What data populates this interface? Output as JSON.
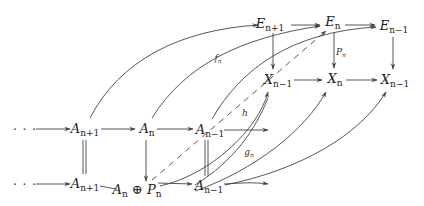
{
  "diagram": {
    "type": "commutative-diagram",
    "nodes": {
      "E_top_left": {
        "base": "E",
        "sub": "n+1",
        "x": 270,
        "y": 25
      },
      "E_top_mid": {
        "base": "E",
        "sub": "n",
        "x": 332,
        "y": 23
      },
      "E_top_right": {
        "base": "E",
        "sub": "n−1",
        "x": 392,
        "y": 27
      },
      "X_mid_left": {
        "base": "X",
        "sub": "n−1",
        "x": 278,
        "y": 81
      },
      "X_mid_mid": {
        "base": "X",
        "sub": "n",
        "x": 334,
        "y": 80
      },
      "X_mid_right": {
        "base": "X",
        "sub": "n−1",
        "x": 393,
        "y": 81
      },
      "A_row1_left": {
        "base": "A",
        "sub": "n+1",
        "x": 85,
        "y": 130
      },
      "A_row1_mid": {
        "base": "A",
        "sub": "n",
        "x": 147,
        "y": 130
      },
      "A_row1_right": {
        "base": "A",
        "sub": "n−1",
        "x": 209,
        "y": 131
      },
      "A_row2_left": {
        "base": "A",
        "sub": "n+1",
        "x": 85,
        "y": 185
      },
      "A_row2_sum": {
        "base": "A",
        "sub": "n",
        "op": "⊕",
        "base2": "P",
        "sub2": "n",
        "x": 135,
        "y": 191
      },
      "A_row2_right": {
        "base": "A",
        "sub": "n−1",
        "x": 207,
        "y": 187
      }
    },
    "ellipsis": {
      "text": "· · ·",
      "row1": {
        "x": 25,
        "y": 130
      },
      "row2": {
        "x": 25,
        "y": 185
      }
    },
    "arrow_labels": {
      "f_n": {
        "base": "f",
        "sub": "n",
        "x": 218,
        "y": 58
      },
      "P_n": {
        "base": "P",
        "sub": "n",
        "x": 340,
        "y": 52
      },
      "h": {
        "base": "h",
        "sub": "",
        "x": 245,
        "y": 113
      },
      "g_n": {
        "base": "g",
        "sub": "n",
        "x": 249,
        "y": 152
      }
    },
    "stroke_color": "#444444"
  }
}
